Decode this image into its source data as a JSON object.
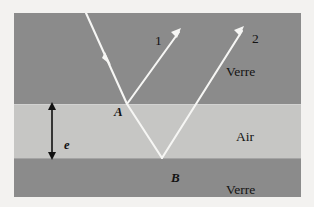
{
  "figure": {
    "type": "optics-ray-diagram"
  },
  "layers": [
    {
      "name": "glass-top",
      "label": "Verre",
      "color": "#8b8b8b"
    },
    {
      "name": "air-middle",
      "label": "Air",
      "color": "#c6c6c4"
    },
    {
      "name": "glass-bottom",
      "label": "Verre",
      "color": "#8b8b8b"
    }
  ],
  "labels": {
    "verre_top": "Verre",
    "air": "Air",
    "verre_bottom": "Verre",
    "point_a": "A",
    "point_b": "B",
    "ray_1": "1",
    "ray_2": "2",
    "thickness": "e"
  },
  "rays": {
    "incident": {
      "name": "incident-ray",
      "from": [
        72,
        0
      ],
      "to": [
        113,
        91
      ],
      "arrow_at": [
        93,
        44
      ]
    },
    "reflected_1": {
      "name": "reflected-ray-1",
      "from": [
        113,
        91
      ],
      "to": [
        165,
        16
      ],
      "label": "1"
    },
    "refracted": {
      "name": "refracted-ray-in-air",
      "from": [
        113,
        91
      ],
      "to": [
        148,
        145
      ]
    },
    "reflected_2": {
      "name": "reflected-ray-2",
      "from": [
        148,
        145
      ],
      "to": [
        227,
        15
      ],
      "label": "2"
    }
  },
  "dimension": {
    "name": "air-thickness",
    "symbol": "e",
    "x": 52,
    "top": 91,
    "bottom": 145
  },
  "colors": {
    "glass": "#8b8b8b",
    "air": "#c6c6c4",
    "ray": "#f6f6f4",
    "text": "#131313",
    "page": "#f3f2f0"
  }
}
